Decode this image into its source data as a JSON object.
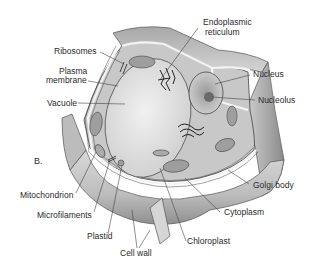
{
  "figure": {
    "panel_letter": "B.",
    "labels": {
      "ribosomes": "Ribosomes",
      "plasma_membrane_1": "Plasma",
      "plasma_membrane_2": "membrane",
      "vacuole": "Vacuole",
      "er_1": "Endoplasmic",
      "er_2": "reticulum",
      "nucleus": "Nucleus",
      "nucleolus": "Nucleolus",
      "mitochondrion": "Mitochondrion",
      "microfilaments": "Microfilaments",
      "plastid": "Plastid",
      "cell_wall": "Cell wall",
      "chloroplast": "Chloroplast",
      "cytoplasm": "Cytoplasm",
      "golgi_body": "Golgi body"
    }
  }
}
